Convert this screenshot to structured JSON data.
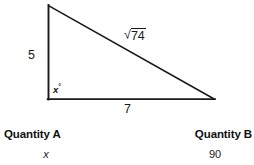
{
  "figure": {
    "type": "right-triangle",
    "vertices": {
      "apex": [
        48,
        6
      ],
      "right_angle": [
        48,
        99
      ],
      "right": [
        214,
        99
      ]
    },
    "stroke_color": "#1a1a1a",
    "background_color": "#ffffff",
    "labels": {
      "vertical_leg": "5",
      "horizontal_leg": "7",
      "hypotenuse_radical": "√",
      "hypotenuse_radicand": "74",
      "angle_variable": "x",
      "angle_degree_symbol": "°"
    }
  },
  "comparison": {
    "quantity_a_header": "Quantity A",
    "quantity_b_header": "Quantity B",
    "quantity_a_value": "x",
    "quantity_b_value": "90"
  }
}
